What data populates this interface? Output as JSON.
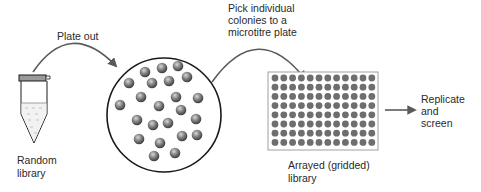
{
  "diagram": {
    "type": "process-flow",
    "title": "",
    "steps": [
      {
        "id": "random-library",
        "label_lines": [
          "Random",
          "library"
        ],
        "shape": "microcentrifuge-tube"
      },
      {
        "id": "agar-plate",
        "label_lines": [],
        "shape": "petri-dish-with-colonies",
        "colony_count": 26
      },
      {
        "id": "arrayed-library",
        "label_lines": [
          "Arrayed (gridded)",
          "library"
        ],
        "shape": "microtitre-plate",
        "rows": 8,
        "columns": 12
      },
      {
        "id": "replicate-screen",
        "label_lines": [
          "Replicate",
          "and",
          "screen"
        ],
        "shape": "text"
      }
    ],
    "arrows": [
      {
        "from": "random-library",
        "to": "agar-plate",
        "label_lines": [
          "Plate out"
        ],
        "style": "curved"
      },
      {
        "from": "agar-plate",
        "to": "arrayed-library",
        "label_lines": [
          "Pick individual",
          "colonies to a",
          "microtitre plate"
        ],
        "style": "curved"
      },
      {
        "from": "arrayed-library",
        "to": "replicate-screen",
        "label_lines": [],
        "style": "straight"
      }
    ]
  },
  "labels": {
    "plate_out": "Plate out",
    "pick_1": "Pick individual",
    "pick_2": "colonies to a",
    "pick_3": "microtitre plate",
    "random_1": "Random",
    "random_2": "library",
    "arrayed_1": "Arrayed (gridded)",
    "arrayed_2": "library",
    "replicate_1": "Replicate",
    "replicate_2": "and",
    "replicate_3": "screen"
  },
  "colors": {
    "outline": "#1a1a1a",
    "arrow": "#5a5a5a",
    "tube_cap": "#9a9a9a",
    "colony": "#707070",
    "well": "#6e6e6e",
    "plate_border": "#a0a0a0",
    "text": "#2a2a2a"
  }
}
